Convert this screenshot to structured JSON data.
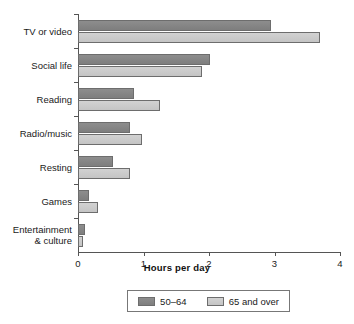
{
  "chart_data": {
    "type": "bar",
    "orientation": "horizontal",
    "title": "",
    "xlabel": "Hours per day",
    "ylabel": "",
    "xlim": [
      0,
      4
    ],
    "xticks": [
      "0",
      "1",
      "2",
      "3",
      "4"
    ],
    "grid": false,
    "legend_position": "bottom",
    "categories": [
      "TV or video",
      "Social life",
      "Reading",
      "Radio/music",
      "Resting",
      "Games",
      "Entertainment\n& culture"
    ],
    "series": [
      {
        "name": "50–64",
        "color": "#868686",
        "values": [
          2.95,
          2.02,
          0.85,
          0.79,
          0.54,
          0.17,
          0.1
        ]
      },
      {
        "name": "65 and over",
        "color": "#c9c9c9",
        "values": [
          3.7,
          1.9,
          1.25,
          0.97,
          0.79,
          0.3,
          0.08
        ]
      }
    ]
  },
  "legend": {
    "items": [
      {
        "label": "50–64"
      },
      {
        "label": "65 and over"
      }
    ]
  }
}
